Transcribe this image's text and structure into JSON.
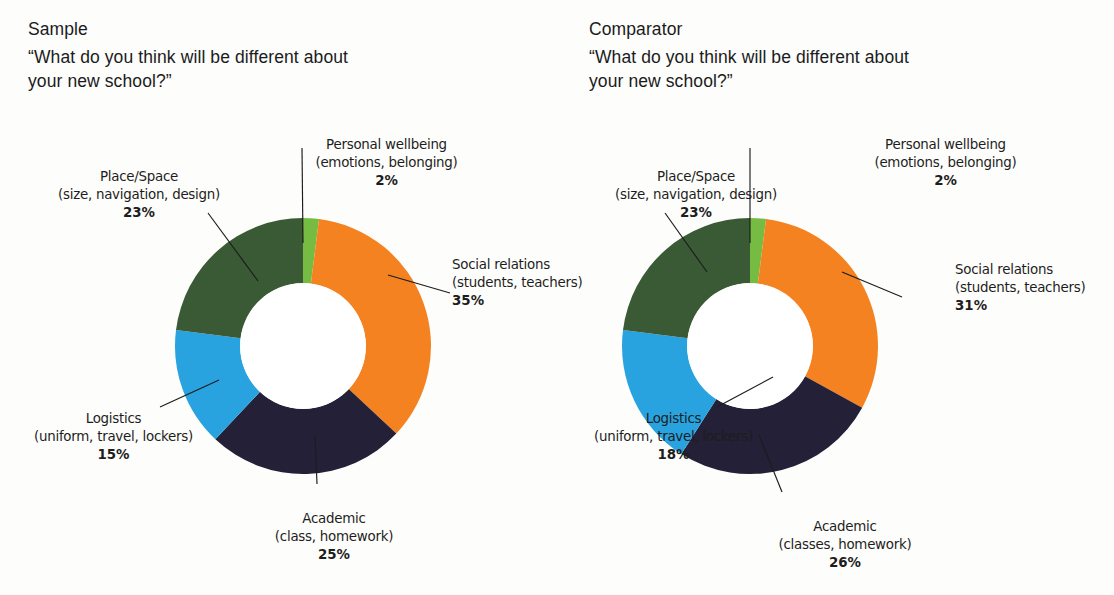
{
  "colors": {
    "orange": "#f58220",
    "navy": "#232038",
    "blue": "#29a3e0",
    "dark_green": "#3a5a35",
    "bright_green": "#76bc43",
    "background": "#fdfdfb",
    "text": "#1d1d1d"
  },
  "panels": {
    "left": {
      "kicker": "Sample",
      "question": "“What do you think will be different about\n your new school?”",
      "labels": {
        "wellbeing": {
          "name": "Personal wellbeing\n(emotions, belonging)",
          "pct": "2%"
        },
        "place": {
          "name": "Place/Space\n(size, navigation, design)",
          "pct": "23%"
        },
        "social": {
          "name": "Social relations\n(students, teachers)",
          "pct": "35%"
        },
        "logistics": {
          "name": "Logistics\n(uniform, travel, lockers)",
          "pct": "15%"
        },
        "academic": {
          "name": "Academic\n(class, homework)",
          "pct": "25%"
        }
      }
    },
    "right": {
      "kicker": "Comparator",
      "question": "“What do you think will be different about\n your new school?”",
      "labels": {
        "wellbeing": {
          "name": "Personal wellbeing\n(emotions, belonging)",
          "pct": "2%"
        },
        "place": {
          "name": "Place/Space\n(size, navigation, design)",
          "pct": "23%"
        },
        "social": {
          "name": "Social relations\n(students, teachers)",
          "pct": "31%"
        },
        "logistics": {
          "name": "Logistics\n(uniform, travel, lockers)",
          "pct": "18%"
        },
        "academic": {
          "name": "Academic\n(classes, homework)",
          "pct": "26%"
        }
      }
    }
  },
  "chart_data": [
    {
      "type": "pie",
      "variant": "donut",
      "title": "Sample",
      "subtitle": "“What do you think will be different about your new school?”",
      "labels": [
        "Personal wellbeing (emotions, belonging)",
        "Social relations (students, teachers)",
        "Academic (class, homework)",
        "Logistics (uniform, travel, lockers)",
        "Place/Space (size, navigation, design)"
      ],
      "values": [
        2,
        35,
        25,
        15,
        23
      ],
      "unit": "%",
      "colors": [
        "#76bc43",
        "#f58220",
        "#232038",
        "#29a3e0",
        "#3a5a35"
      ],
      "start_angle_deg": 0,
      "direction": "clockwise",
      "inner_radius_ratio": 0.49,
      "legend": "callout-labels",
      "grid": false
    },
    {
      "type": "pie",
      "variant": "donut",
      "title": "Comparator",
      "subtitle": "“What do you think will be different about your new school?”",
      "labels": [
        "Personal wellbeing (emotions, belonging)",
        "Social relations (students, teachers)",
        "Academic (classes, homework)",
        "Logistics (uniform, travel, lockers)",
        "Place/Space (size, navigation, design)"
      ],
      "values": [
        2,
        31,
        26,
        18,
        23
      ],
      "unit": "%",
      "colors": [
        "#76bc43",
        "#f58220",
        "#232038",
        "#29a3e0",
        "#3a5a35"
      ],
      "start_angle_deg": 0,
      "direction": "clockwise",
      "inner_radius_ratio": 0.49,
      "legend": "callout-labels",
      "grid": false
    }
  ]
}
